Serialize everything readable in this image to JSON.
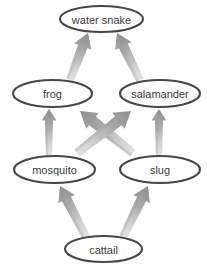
{
  "diagram": {
    "type": "food-web",
    "background_color": "#ffffff",
    "node_stroke_color": "#474747",
    "node_fill_color": "#ffffff",
    "label_color": "#3b3b3b",
    "arrow_color_dark": "#8d8d8d",
    "arrow_color_light": "#e3e3e3",
    "nodes": [
      {
        "id": "water_snake",
        "label": "water snake",
        "cx": 101.5,
        "cy": 19,
        "rx": 41.5,
        "ry": 13,
        "font_size": 11,
        "trophic_level": "tertiary-consumer"
      },
      {
        "id": "frog",
        "label": "frog",
        "cx": 52.5,
        "cy": 93.5,
        "rx": 39.5,
        "ry": 13.5,
        "font_size": 11,
        "trophic_level": "secondary-consumer"
      },
      {
        "id": "salamander",
        "label": "salamander",
        "cx": 160,
        "cy": 93.5,
        "rx": 40,
        "ry": 13.5,
        "font_size": 11,
        "trophic_level": "secondary-consumer"
      },
      {
        "id": "mosquito",
        "label": "mosquito",
        "cx": 54.5,
        "cy": 169.5,
        "rx": 40.5,
        "ry": 13.5,
        "font_size": 11,
        "trophic_level": "primary-consumer"
      },
      {
        "id": "slug",
        "label": "slug",
        "cx": 160,
        "cy": 169.5,
        "rx": 40,
        "ry": 13.5,
        "font_size": 11,
        "trophic_level": "primary-consumer"
      },
      {
        "id": "cattail",
        "label": "cattail",
        "cx": 103.5,
        "cy": 249,
        "rx": 38.5,
        "ry": 13,
        "font_size": 11,
        "trophic_level": "producer"
      }
    ],
    "edges": [
      {
        "id": "frog-to-water-snake",
        "from": "frog",
        "to": "water_snake",
        "x1": 70,
        "y1": 80,
        "x2": 88,
        "y2": 33,
        "width": 10
      },
      {
        "id": "salamander-to-water-snake",
        "from": "salamander",
        "to": "water_snake",
        "x1": 140,
        "y1": 80,
        "x2": 117,
        "y2": 33,
        "width": 10
      },
      {
        "id": "mosquito-to-frog",
        "from": "mosquito",
        "to": "frog",
        "x1": 49,
        "y1": 155,
        "x2": 49,
        "y2": 109,
        "width": 8
      },
      {
        "id": "slug-to-salamander",
        "from": "slug",
        "to": "salamander",
        "x1": 159,
        "y1": 155,
        "x2": 159,
        "y2": 109,
        "width": 8
      },
      {
        "id": "slug-to-frog",
        "from": "slug",
        "to": "frog",
        "x1": 133,
        "y1": 153,
        "x2": 80,
        "y2": 111,
        "width": 11
      },
      {
        "id": "mosquito-to-salamander",
        "from": "mosquito",
        "to": "salamander",
        "x1": 77,
        "y1": 153,
        "x2": 131,
        "y2": 111,
        "width": 11
      },
      {
        "id": "cattail-to-mosquito",
        "from": "cattail",
        "to": "mosquito",
        "x1": 86,
        "y1": 237,
        "x2": 60,
        "y2": 186,
        "width": 10
      },
      {
        "id": "cattail-to-slug",
        "from": "cattail",
        "to": "slug",
        "x1": 123,
        "y1": 237,
        "x2": 148,
        "y2": 186,
        "width": 10
      }
    ]
  }
}
